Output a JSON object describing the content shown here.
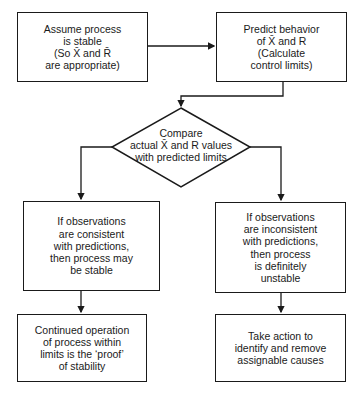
{
  "diagram": {
    "type": "flowchart",
    "nodes": [
      {
        "id": "assume",
        "shape": "rectangle",
        "text": "Assume process\nis stable\n(So X̄ and R̄\nare appropriate)"
      },
      {
        "id": "predict",
        "shape": "rectangle",
        "text": "Predict behavior\nof X̄ and R\n(Calculate\ncontrol limits)"
      },
      {
        "id": "compare",
        "shape": "diamond",
        "text": "Compare\nactual X̄ and R values\nwith predicted limits"
      },
      {
        "id": "consistent",
        "shape": "rectangle",
        "text": "If observations\nare consistent\nwith predictions,\nthen process may\nbe stable"
      },
      {
        "id": "inconsistent",
        "shape": "rectangle",
        "text": "If observations\nare inconsistent\nwith predictions,\nthen process\nis definitely\nunstable"
      },
      {
        "id": "continued",
        "shape": "rectangle",
        "text": "Continued operation\nof process within\nlimits is the ‘proof’\nof stability"
      },
      {
        "id": "action",
        "shape": "rectangle",
        "text": "Take action to\nidentify and remove\nassignable causes"
      }
    ],
    "edges": [
      {
        "from": "assume",
        "to": "predict"
      },
      {
        "from": "predict",
        "to": "compare"
      },
      {
        "from": "compare",
        "to": "consistent"
      },
      {
        "from": "compare",
        "to": "inconsistent"
      },
      {
        "from": "consistent",
        "to": "continued"
      },
      {
        "from": "inconsistent",
        "to": "action"
      }
    ]
  },
  "labels": {
    "assume": "Assume process\nis stable\n(So X̄ and R̄\nare appropriate)",
    "predict": "Predict behavior\nof X̄ and R\n(Calculate\ncontrol limits)",
    "compare": "Compare\nactual X̄ and R values\nwith predicted limits",
    "consistent": "If observations\nare consistent\nwith predictions,\nthen process may\nbe stable",
    "inconsistent": "If observations\nare inconsistent\nwith predictions,\nthen process\nis definitely\nunstable",
    "continued": "Continued operation\nof process within\nlimits is the ‘proof’\nof stability",
    "action": "Take action to\nidentify and remove\nassignable causes"
  },
  "colors": {
    "stroke": "#1a1a1a",
    "background": "#ffffff"
  }
}
